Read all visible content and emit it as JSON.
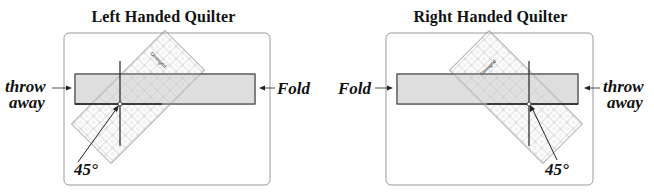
{
  "panels": [
    {
      "id": "left",
      "title": "Left Handed Quilter",
      "left_label": [
        "throw",
        "away"
      ],
      "right_label": "Fold",
      "angle_label": "45°",
      "ruler_brand": "Omnigrid"
    },
    {
      "id": "right",
      "title": "Right Handed Quilter",
      "left_label": "Fold",
      "right_label": [
        "throw",
        "away"
      ],
      "angle_label": "45°",
      "ruler_brand": "Omnigrid"
    }
  ],
  "colors": {
    "strip_fill": "#e3e3e3",
    "strip_stroke": "#555555",
    "frame_stroke": "#9a9a9a",
    "ruler_stroke": "#8a8a8a",
    "line": "#222222"
  }
}
